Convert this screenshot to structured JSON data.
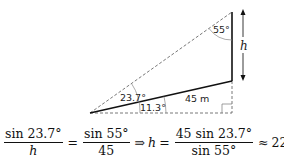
{
  "diagram": {
    "angle_top": "55°",
    "angle_left_outer": "23.7°",
    "angle_left_inner": "11.3°",
    "side_length": "45 m",
    "height_label": "h"
  },
  "formula": {
    "lhs_num": "sin 23.7°",
    "lhs_den": "h",
    "eq1": "=",
    "rhs_num": "sin 55°",
    "rhs_den": "45",
    "implies": "⇒",
    "var": "h",
    "eq2": "=",
    "res_num": "45 sin 23.7°",
    "res_den": "sin 55°",
    "approx": "≈",
    "result": "22.0809"
  }
}
